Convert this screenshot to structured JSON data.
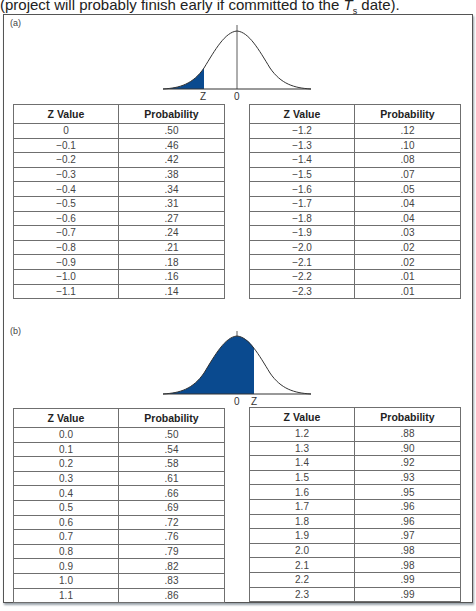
{
  "caption": {
    "text_before": "(project will probably finish early if committed to the ",
    "ts_main": "T",
    "ts_sub": "s",
    "text_after": " date)."
  },
  "colors": {
    "shade": "#0a4a8f",
    "curve": "#333333",
    "border": "#6f6f6f"
  },
  "panel_a": {
    "label": "(a)",
    "curve": {
      "shaded_region": "left tail",
      "z_label": "Z",
      "zero_label": "0"
    },
    "headers": {
      "z": "Z Value",
      "p": "Probability"
    },
    "left_table": [
      {
        "z": "0",
        "p": ".50"
      },
      {
        "z": "−0.1",
        "p": ".46"
      },
      {
        "z": "−0.2",
        "p": ".42"
      },
      {
        "z": "−0.3",
        "p": ".38"
      },
      {
        "z": "−0.4",
        "p": ".34"
      },
      {
        "z": "−0.5",
        "p": ".31"
      },
      {
        "z": "−0.6",
        "p": ".27"
      },
      {
        "z": "−0.7",
        "p": ".24"
      },
      {
        "z": "−0.8",
        "p": ".21"
      },
      {
        "z": "−0.9",
        "p": ".18"
      },
      {
        "z": "−1.0",
        "p": ".16"
      },
      {
        "z": "−1.1",
        "p": ".14"
      }
    ],
    "right_table": [
      {
        "z": "−1.2",
        "p": ".12"
      },
      {
        "z": "−1.3",
        "p": ".10"
      },
      {
        "z": "−1.4",
        "p": ".08"
      },
      {
        "z": "−1.5",
        "p": ".07"
      },
      {
        "z": "−1.6",
        "p": ".05"
      },
      {
        "z": "−1.7",
        "p": ".04"
      },
      {
        "z": "−1.8",
        "p": ".04"
      },
      {
        "z": "−1.9",
        "p": ".03"
      },
      {
        "z": "−2.0",
        "p": ".02"
      },
      {
        "z": "−2.1",
        "p": ".02"
      },
      {
        "z": "−2.2",
        "p": ".01"
      },
      {
        "z": "−2.3",
        "p": ".01"
      }
    ]
  },
  "panel_b": {
    "label": "(b)",
    "curve": {
      "shaded_region": "left of Z (Z > 0)",
      "z_label": "Z",
      "zero_label": "0"
    },
    "headers": {
      "z": "Z Value",
      "p": "Probability"
    },
    "left_table": [
      {
        "z": "0.0",
        "p": ".50"
      },
      {
        "z": "0.1",
        "p": ".54"
      },
      {
        "z": "0.2",
        "p": ".58"
      },
      {
        "z": "0.3",
        "p": ".61"
      },
      {
        "z": "0.4",
        "p": ".66"
      },
      {
        "z": "0.5",
        "p": ".69"
      },
      {
        "z": "0.6",
        "p": ".72"
      },
      {
        "z": "0.7",
        "p": ".76"
      },
      {
        "z": "0.8",
        "p": ".79"
      },
      {
        "z": "0.9",
        "p": ".82"
      },
      {
        "z": "1.0",
        "p": ".83"
      },
      {
        "z": "1.1",
        "p": ".86"
      }
    ],
    "right_table": [
      {
        "z": "1.2",
        "p": ".88"
      },
      {
        "z": "1.3",
        "p": ".90"
      },
      {
        "z": "1.4",
        "p": ".92"
      },
      {
        "z": "1.5",
        "p": ".93"
      },
      {
        "z": "1.6",
        "p": ".95"
      },
      {
        "z": "1.7",
        "p": ".96"
      },
      {
        "z": "1.8",
        "p": ".96"
      },
      {
        "z": "1.9",
        "p": ".97"
      },
      {
        "z": "2.0",
        "p": ".98"
      },
      {
        "z": "2.1",
        "p": ".98"
      },
      {
        "z": "2.2",
        "p": ".99"
      },
      {
        "z": "2.3",
        "p": ".99"
      }
    ]
  }
}
